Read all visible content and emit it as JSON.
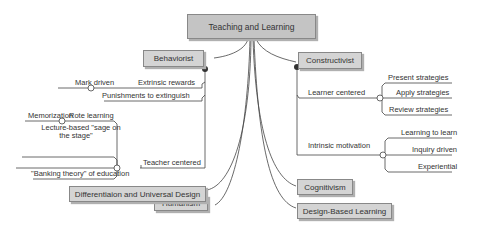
{
  "root": {
    "label": "Teaching and Learning"
  },
  "left_branches": {
    "behaviorist": {
      "label": "Behaviorist",
      "children": {
        "extrinsic_rewards": {
          "label": "Extrinsic rewards",
          "children": [
            "Mark driven"
          ]
        },
        "punishments": {
          "label": "Punishments to extinguish"
        },
        "teacher_centered": {
          "label": "Teacher centered",
          "children": {
            "rote_learning": {
              "label": "Rote learning",
              "children": [
                "Memorization"
              ]
            },
            "lecture": {
              "label_line1": "Lecture-based \"sage on",
              "label_line2": "the stage\""
            },
            "banking": {
              "label": "\"Banking theory\" of education"
            }
          }
        }
      }
    },
    "humanism": {
      "label": "Humanism"
    },
    "differentiation": {
      "label": "Differentiaion and Universal Design"
    }
  },
  "right_branches": {
    "constructivist": {
      "label": "Constructivist",
      "children": {
        "learner_centered": {
          "label": "Learner centered",
          "children": [
            "Present strategies",
            "Apply strategies",
            "Review strategies"
          ]
        },
        "intrinsic_motivation": {
          "label": "Intrinsic motivation",
          "children": [
            "Learning to learn",
            "Inquiry driven",
            "Experiential"
          ]
        }
      }
    },
    "cognitivism": {
      "label": "Cognitivism"
    },
    "design_based": {
      "label": "Design-Based Learning"
    }
  }
}
